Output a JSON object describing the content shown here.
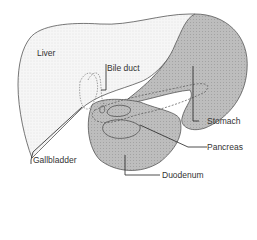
{
  "diagram": {
    "labels": {
      "liver": "Liver",
      "bile_duct": "Bile duct",
      "stomach": "Stomach",
      "pancreas": "Pancreas",
      "gallbladder": "Gallbladder",
      "duodenum": "Duodenum"
    },
    "colors": {
      "liver_fill": "#f4f4f4",
      "organ_fill": "#b9b9b9",
      "stomach_fill": "#c4c4c4",
      "outline": "#555555",
      "leader": "#222222"
    }
  }
}
